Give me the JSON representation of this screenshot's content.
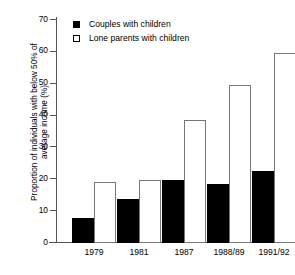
{
  "chart_data": {
    "type": "bar",
    "title": "",
    "xlabel": "",
    "ylabel": "Proportion of individuals with below 50% of average income (%)",
    "ylabel_line1": "Proportion of individuals with below 50% of",
    "ylabel_line2": "average income (%)",
    "ylim": [
      0,
      70
    ],
    "ytick_values": [
      0,
      10,
      20,
      30,
      40,
      50,
      60,
      70
    ],
    "ytick_labels": [
      "0",
      "10",
      "20",
      "30",
      "40",
      "50",
      "60",
      "70"
    ],
    "grid": false,
    "legend_position": "top-center",
    "categories": [
      "1979",
      "1981",
      "1987",
      "1988/89",
      "1991/92"
    ],
    "series": [
      {
        "name": "Couples with children",
        "color": "#000000",
        "style": "filled",
        "values": [
          8,
          13.8,
          19.8,
          18.5,
          22.6
        ]
      },
      {
        "name": "Lone parents with children",
        "color": "#ffffff",
        "style": "open",
        "values": [
          19,
          19.8,
          38.5,
          49.5,
          59.5
        ]
      }
    ]
  },
  "legend": {
    "items": [
      {
        "label": "Couples with children",
        "swatch": "filled-square-icon"
      },
      {
        "label": "Lone parents with children",
        "swatch": "open-square-icon"
      }
    ]
  },
  "colors": {
    "couples": "#000000",
    "lone": "#ffffff",
    "lone_border": "#777777",
    "axis": "#555555",
    "background": "#ffffff"
  }
}
